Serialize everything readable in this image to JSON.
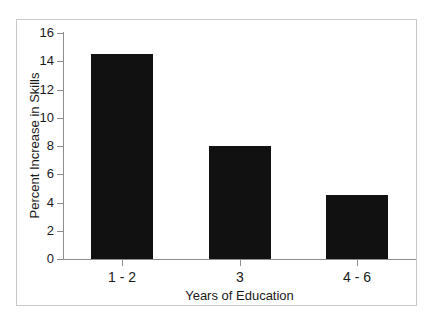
{
  "chart_data": {
    "type": "bar",
    "title": "",
    "subtitle": "",
    "xlabel": "Years of Education",
    "ylabel": "Percent Increase in Skills",
    "categories": [
      "1 - 2",
      "3",
      "4 - 6"
    ],
    "values": [
      14.5,
      8.0,
      4.5
    ],
    "series": [
      {
        "name": "Percent Increase in Skills",
        "values": [
          14.5,
          8.0,
          4.5
        ]
      }
    ],
    "ylim": [
      0,
      16
    ],
    "ytick_labels": [
      "0",
      "2",
      "4",
      "6",
      "8",
      "10",
      "12",
      "14",
      "16"
    ],
    "ytick_values": [
      0,
      2,
      4,
      6,
      8,
      10,
      12,
      14,
      16
    ],
    "xtick_labels": [
      "1 - 2",
      "3",
      "4 - 6"
    ],
    "grid": false,
    "legend": false,
    "legend_position": "none",
    "annotations": [],
    "bar_color": "#111111",
    "axis_color": "#8e8e8e",
    "frame_color": "#c9c9c9",
    "background_color": "#ffffff"
  }
}
